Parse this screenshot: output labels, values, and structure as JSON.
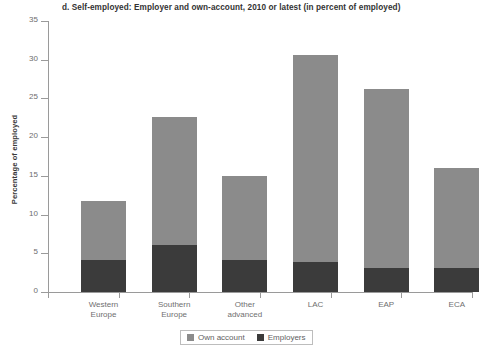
{
  "chart_data": {
    "type": "bar",
    "subtype": "stacked-bar",
    "title": "d. Self-employed: Employer and own-account, 2010 or latest (in percent of employed)",
    "xlabel": "",
    "ylabel": "Percentage of employed",
    "ylim": [
      0,
      35
    ],
    "yticks": [
      0,
      5,
      10,
      15,
      20,
      25,
      30,
      35
    ],
    "ytick_labels": [
      "0",
      "5",
      "10",
      "15",
      "20",
      "25",
      "30",
      "35"
    ],
    "grid": false,
    "legend_position": "bottom-center",
    "categories": [
      "Western Europe",
      "Southern Europe",
      "Other advanced",
      "LAC",
      "EAP",
      "ECA"
    ],
    "category_lines": [
      [
        "Western",
        "Europe"
      ],
      [
        "Southern",
        "Europe"
      ],
      [
        "Other",
        "advanced"
      ],
      [
        "LAC",
        ""
      ],
      [
        "EAP",
        ""
      ],
      [
        "ECA",
        ""
      ]
    ],
    "series": [
      {
        "name": "Own account",
        "color": "#8b8b8b",
        "values": [
          7.7,
          16.5,
          10.9,
          26.7,
          23.1,
          12.9
        ]
      },
      {
        "name": "Employers",
        "color": "#3b3b3b",
        "values": [
          4.1,
          6.1,
          4.1,
          3.9,
          3.1,
          3.1
        ]
      }
    ],
    "totals": [
      11.8,
      22.6,
      15.0,
      30.6,
      26.2,
      16.0
    ]
  },
  "legend": {
    "items": [
      {
        "label": "Own account",
        "color": "#8b8b8b",
        "swatch": "square-swatch-gray"
      },
      {
        "label": "Employers",
        "color": "#3b3b3b",
        "swatch": "square-swatch-dark"
      }
    ]
  },
  "colors": {
    "own_account": "#8b8b8b",
    "employers": "#3b3b3b",
    "axis": "#9a9a9a",
    "tick_text": "#6d6d6d",
    "title_text": "#333333",
    "background": "#ffffff"
  }
}
